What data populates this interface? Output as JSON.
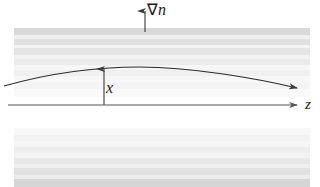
{
  "figure": {
    "width": 320,
    "height": 187,
    "background": "#ffffff"
  },
  "labels": {
    "gradient": "∇n",
    "gradient_nabla": "∇",
    "gradient_n": "n",
    "height": "x",
    "axis": "z"
  },
  "axes": {
    "z_axis": {
      "name": "z",
      "label": "z",
      "y": 105,
      "x_start": 8,
      "x_end": 298,
      "arrowhead": "right"
    },
    "x_arrow": {
      "name": "x",
      "label": "x",
      "x": 104,
      "y_base": 105,
      "y_tip": 68,
      "arrowhead": "up"
    },
    "gradient_arrow": {
      "name": "grad-n",
      "label": "∇n",
      "x": 145,
      "y_base": 32,
      "y_tip": 11,
      "arrowhead": "up"
    }
  },
  "ray": {
    "name": "light-ray",
    "description": "curved ray bending toward higher refractive index",
    "start": [
      4,
      86
    ],
    "apex": [
      140,
      67
    ],
    "end": [
      300,
      89
    ],
    "arrowhead": "right",
    "color": "#2b2b2b"
  },
  "bands": {
    "description": "horizontal strata indicating refractive index layers",
    "upper": [
      {
        "y": 28,
        "height": 7,
        "color": "#d8d8d8"
      },
      {
        "y": 35,
        "height": 4,
        "color": "#efefef"
      },
      {
        "y": 39,
        "height": 6,
        "color": "#e0e0e0"
      },
      {
        "y": 45,
        "height": 3,
        "color": "#f4f4f4"
      },
      {
        "y": 48,
        "height": 7,
        "color": "#e4e4e4"
      },
      {
        "y": 55,
        "height": 4,
        "color": "#f2f2f2"
      },
      {
        "y": 59,
        "height": 6,
        "color": "#ebebeb"
      },
      {
        "y": 65,
        "height": 5,
        "color": "#f6f6f6"
      },
      {
        "y": 70,
        "height": 6,
        "color": "#f0f0f0"
      },
      {
        "y": 76,
        "height": 6,
        "color": "#f7f7f7"
      },
      {
        "y": 82,
        "height": 7,
        "color": "#f4f4f4"
      },
      {
        "y": 89,
        "height": 8,
        "color": "#fafafa"
      }
    ],
    "lower": [
      {
        "y": 128,
        "height": 7,
        "color": "#f8f8f8"
      },
      {
        "y": 135,
        "height": 6,
        "color": "#f2f2f2"
      },
      {
        "y": 141,
        "height": 6,
        "color": "#f6f6f6"
      },
      {
        "y": 147,
        "height": 6,
        "color": "#eeeeee"
      },
      {
        "y": 153,
        "height": 5,
        "color": "#f3f3f3"
      },
      {
        "y": 158,
        "height": 6,
        "color": "#e8e8e8"
      },
      {
        "y": 164,
        "height": 4,
        "color": "#f0f0f0"
      },
      {
        "y": 168,
        "height": 7,
        "color": "#e2e2e2"
      },
      {
        "y": 175,
        "height": 4,
        "color": "#ececec"
      },
      {
        "y": 179,
        "height": 8,
        "color": "#d6d6d6"
      }
    ],
    "x_start": 14,
    "x_end": 310
  },
  "colors": {
    "line": "#2b2b2b",
    "axis": "#555555",
    "text": "#1a1a1a",
    "band_dark": "#d6d6d6",
    "band_light": "#fafafa"
  }
}
